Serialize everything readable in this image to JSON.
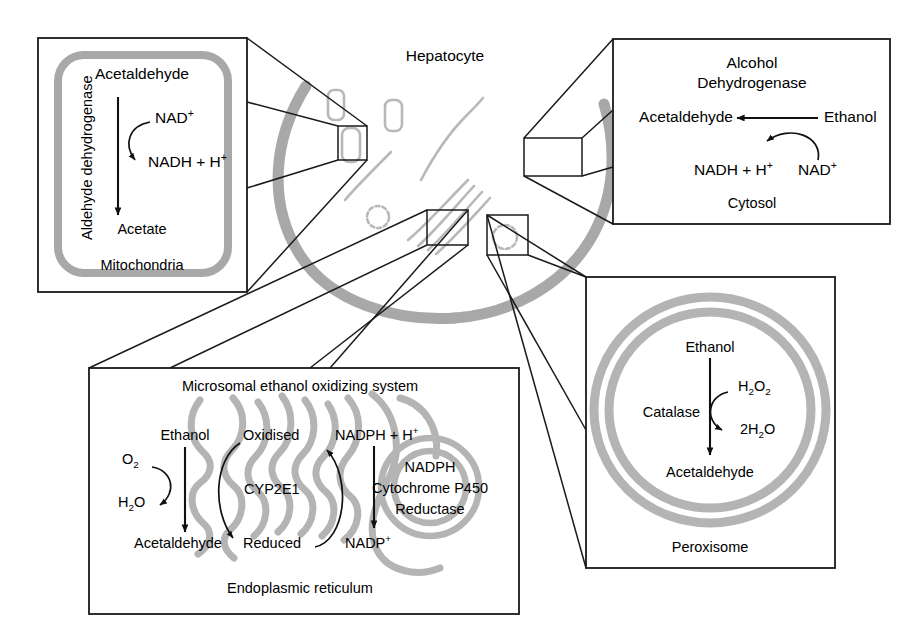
{
  "figure": {
    "center_label": "Hepatocyte",
    "colors": {
      "membrane_gray": "#a8a8a8",
      "organelle_gray": "#b4b4b4",
      "stroke_black": "#1a1a1a",
      "background": "#ffffff"
    }
  },
  "panels": {
    "mitochondria": {
      "compartment": "Mitochondria",
      "enzyme": "Aldehyde dehydrogenase",
      "substrate": "Acetaldehyde",
      "product": "Acetate",
      "cofactor_in": "NAD",
      "cofactor_in_charge": "+",
      "cofactor_out": "NADH + H",
      "cofactor_out_charge": "+"
    },
    "cytosol": {
      "compartment": "Cytosol",
      "enzyme_line1": "Alcohol",
      "enzyme_line2": "Dehydrogenase",
      "substrate": "Ethanol",
      "product": "Acetaldehyde",
      "cofactor_in": "NAD",
      "cofactor_in_charge": "+",
      "cofactor_out": "NADH + H",
      "cofactor_out_charge": "+"
    },
    "endoplasmic_reticulum": {
      "compartment": "Endoplasmic reticulum",
      "system_title": "Microsomal ethanol oxidizing system",
      "substrate": "Ethanol",
      "product": "Acetaldehyde",
      "oxygen": "O",
      "oxygen_sub": "2",
      "water": "H",
      "water_sub": "2",
      "water_tail": "O",
      "enzyme": "CYP2E1",
      "state_oxidised": "Oxidised",
      "state_reduced": "Reduced",
      "cofactor_in": "NADPH + H",
      "cofactor_in_charge": "+",
      "cofactor_out": "NADP",
      "cofactor_out_charge": "+",
      "reductase_line1": "NADPH",
      "reductase_line2": "Cytochrome P450",
      "reductase_line3": "Reductase"
    },
    "peroxisome": {
      "compartment": "Peroxisome",
      "enzyme": "Catalase",
      "substrate": "Ethanol",
      "product": "Acetaldehyde",
      "cofactor_in": "H",
      "cofactor_in_sub1": "2",
      "cofactor_in_mid": "O",
      "cofactor_in_sub2": "2",
      "cofactor_out_prefix": "2H",
      "cofactor_out_sub": "2",
      "cofactor_out_tail": "O"
    }
  }
}
